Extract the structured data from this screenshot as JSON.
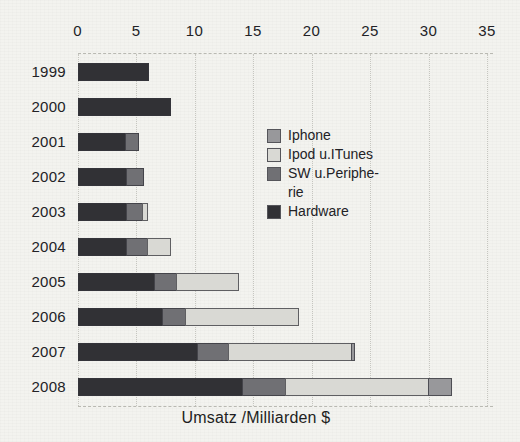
{
  "page": {
    "background": "#f3f3ef"
  },
  "chart_data": {
    "type": "bar",
    "orientation": "horizontal",
    "stacked": true,
    "title": "",
    "xlabel": "Umsatz /Milliarden $",
    "categories": [
      "1999",
      "2000",
      "2001",
      "2002",
      "2003",
      "2004",
      "2005",
      "2006",
      "2007",
      "2008"
    ],
    "xticks": [
      0,
      5,
      10,
      15,
      20,
      25,
      30,
      35
    ],
    "xlim": [
      0,
      35.5
    ],
    "grid": "vertical-dotted",
    "legend_position": "inside-upper-right",
    "series": [
      {
        "name": "Hardware",
        "color": "#313135",
        "values": [
          6.1,
          8.0,
          4.1,
          4.2,
          4.2,
          4.2,
          6.6,
          7.3,
          10.3,
          14.1
        ]
      },
      {
        "name": "SW u.Peripherie",
        "color": "#707074",
        "values": [
          0,
          0,
          1.2,
          1.6,
          1.5,
          1.9,
          2.0,
          2.1,
          2.7,
          3.8
        ]
      },
      {
        "name": "Ipod u.ITunes",
        "color": "#d9d9d4",
        "values": [
          0,
          0,
          0,
          0,
          0.5,
          2.1,
          5.4,
          9.7,
          10.6,
          12.3
        ]
      },
      {
        "name": "Iphone",
        "color": "#98989b",
        "values": [
          0,
          0,
          0,
          0,
          0,
          0,
          0,
          0,
          0.4,
          2.1
        ]
      }
    ],
    "legend": [
      {
        "name": "Iphone",
        "lines": [
          "Iphone"
        ],
        "color": "#98989b"
      },
      {
        "name": "Ipod u.ITunes",
        "lines": [
          "Ipod u.ITunes"
        ],
        "color": "#d9d9d4"
      },
      {
        "name": "SW u.Peripherie",
        "lines": [
          "SW u.Periphe-",
          "rie"
        ],
        "color": "#707074"
      },
      {
        "name": "Hardware",
        "lines": [
          "Hardware"
        ],
        "color": "#313135"
      }
    ],
    "colors": {
      "grid": "#c6c6c0",
      "text": "#222226",
      "background": "#f3f3ef"
    }
  }
}
